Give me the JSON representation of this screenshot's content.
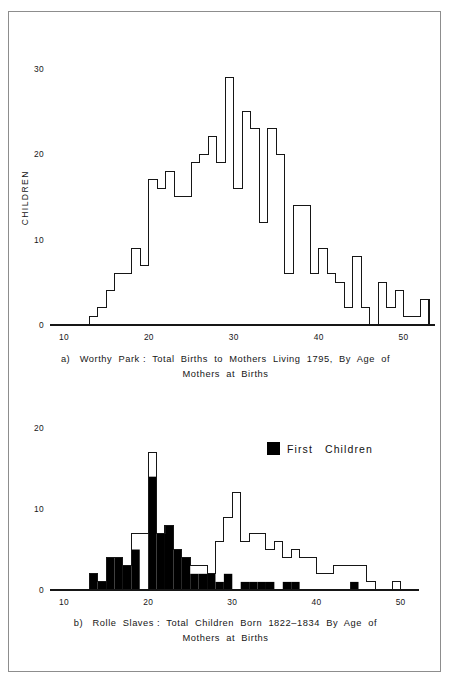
{
  "figure": {
    "background": "#ffffff",
    "frame_color": "#8d8d8d",
    "ink_color": "#161616",
    "fill_color": "#000000"
  },
  "panel_a": {
    "caption_line1": "a)   Worthy  Park :  Total  Births  to  Mothers  Living  1795,  By  Age  of",
    "caption_line2": "Mothers  at  Births",
    "y_axis_title": "CHILDREN",
    "x_axis_title": "AGE",
    "y_ticks": [
      "0",
      "10",
      "20",
      "30"
    ],
    "x_ticks": [
      "10",
      "20",
      "30",
      "40",
      "50"
    ]
  },
  "panel_b": {
    "caption_line1": "b)   Rolle  Slaves :  Total  Children  Born  1822–1834  By  Age  of",
    "caption_line2": "Mothers  at  Births",
    "legend_label": "First   Children",
    "y_ticks": [
      "0",
      "10",
      "20"
    ],
    "x_ticks": [
      "10",
      "20",
      "30",
      "40",
      "50"
    ]
  },
  "chart_data": [
    {
      "id": "worthy-park",
      "type": "bar",
      "title": "a) Worthy Park : Total Births to Mothers Living 1795, By Age of Mothers at Births",
      "xlabel": "AGE",
      "ylabel": "CHILDREN",
      "xlim": [
        10,
        53
      ],
      "ylim": [
        0,
        31
      ],
      "bin_width": 1,
      "grid": false,
      "legend": "none",
      "style": "outline step histogram",
      "x": [
        13,
        14,
        15,
        16,
        17,
        18,
        19,
        20,
        21,
        22,
        23,
        24,
        25,
        26,
        27,
        28,
        29,
        30,
        31,
        32,
        33,
        34,
        35,
        36,
        37,
        38,
        39,
        40,
        41,
        42,
        43,
        44,
        45,
        46,
        47,
        48,
        49,
        50,
        51,
        52
      ],
      "values": [
        1,
        2,
        4,
        6,
        6,
        9,
        7,
        17,
        16,
        18,
        15,
        15,
        19,
        20,
        22,
        19,
        29,
        16,
        25,
        23,
        12,
        23,
        20,
        6,
        14,
        14,
        6,
        9,
        6,
        5,
        2,
        8,
        2,
        0,
        5,
        2,
        4,
        1,
        1,
        3
      ],
      "y_ticks": [
        0,
        10,
        20,
        30
      ],
      "x_ticks": [
        10,
        20,
        30,
        40,
        50
      ]
    },
    {
      "id": "rolle-slaves",
      "type": "bar",
      "title": "b) Rolle Slaves : Total Children Born 1822–1834 By Age of Mothers at Births",
      "xlabel": "",
      "ylabel": "",
      "xlim": [
        10,
        51
      ],
      "ylim": [
        0,
        21
      ],
      "bin_width": 1,
      "grid": false,
      "legend_position": "top-right",
      "style": "outline step histogram with filled sub-series",
      "x": [
        13,
        14,
        15,
        16,
        17,
        18,
        19,
        20,
        21,
        22,
        23,
        24,
        25,
        26,
        27,
        28,
        29,
        30,
        31,
        32,
        33,
        34,
        35,
        36,
        37,
        38,
        39,
        40,
        41,
        42,
        43,
        44,
        45,
        46,
        47,
        48,
        49,
        50
      ],
      "series": [
        {
          "name": "Total Children",
          "fill": "outline",
          "values": [
            2,
            1,
            4,
            4,
            3,
            7,
            7,
            17,
            7,
            8,
            5,
            4,
            3,
            3,
            2,
            6,
            9,
            12,
            6,
            7,
            7,
            5,
            6,
            4,
            5,
            4,
            4,
            2,
            2,
            3,
            3,
            3,
            3,
            1,
            0,
            0,
            1,
            0
          ]
        },
        {
          "name": "First Children",
          "fill": "#000000",
          "values": [
            2,
            1,
            4,
            4,
            3,
            5,
            0,
            14,
            7,
            8,
            5,
            4,
            2,
            2,
            2,
            1,
            2,
            0,
            1,
            1,
            1,
            1,
            0,
            1,
            1,
            0,
            0,
            0,
            0,
            0,
            0,
            1,
            0,
            0,
            0,
            0,
            0,
            0
          ]
        }
      ],
      "y_ticks": [
        0,
        10,
        20
      ],
      "x_ticks": [
        10,
        20,
        30,
        40,
        50
      ]
    }
  ]
}
